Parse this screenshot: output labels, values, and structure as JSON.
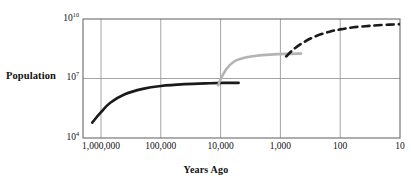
{
  "chart_data": {
    "type": "line",
    "title": "",
    "xlabel": "Years Ago",
    "ylabel": "Population",
    "xscale": "log",
    "yscale": "log",
    "xlim": [
      2000000,
      10
    ],
    "ylim": [
      10000,
      10000000000
    ],
    "x_reversed": true,
    "grid": true,
    "legend_position": "none",
    "xticks": [
      {
        "value": 1000000,
        "label": "1,000,000"
      },
      {
        "value": 100000,
        "label": "100,000"
      },
      {
        "value": 10000,
        "label": "10,000"
      },
      {
        "value": 1000,
        "label": "1,000"
      },
      {
        "value": 100,
        "label": "100"
      },
      {
        "value": 10,
        "label": "10"
      }
    ],
    "yticks": [
      {
        "value": 10000000000,
        "label": "10",
        "exponent": "10"
      },
      {
        "value": 10000000,
        "label": "10",
        "exponent": "7"
      },
      {
        "value": 10000,
        "label": "10",
        "exponent": "4"
      }
    ],
    "series": [
      {
        "name": "hunter-gatherer-phase",
        "style": "solid",
        "color": "#1a1a1a",
        "width": 2.6,
        "points": [
          {
            "x": 1400000,
            "y": 60000
          },
          {
            "x": 1000000,
            "y": 200000
          },
          {
            "x": 700000,
            "y": 600000
          },
          {
            "x": 400000,
            "y": 1600000
          },
          {
            "x": 200000,
            "y": 3000000
          },
          {
            "x": 100000,
            "y": 4200000
          },
          {
            "x": 40000,
            "y": 5200000
          },
          {
            "x": 15000,
            "y": 5800000
          },
          {
            "x": 9000,
            "y": 6000000
          },
          {
            "x": 5000,
            "y": 6000000
          }
        ]
      },
      {
        "name": "agricultural-phase",
        "style": "solid",
        "color": "#b3b3b3",
        "width": 2.6,
        "points": [
          {
            "x": 11000,
            "y": 4500000
          },
          {
            "x": 10000,
            "y": 9000000
          },
          {
            "x": 8000,
            "y": 30000000
          },
          {
            "x": 6000,
            "y": 70000000
          },
          {
            "x": 4000,
            "y": 110000000
          },
          {
            "x": 2500,
            "y": 140000000
          },
          {
            "x": 1500,
            "y": 160000000
          },
          {
            "x": 800,
            "y": 175000000
          },
          {
            "x": 450,
            "y": 180000000
          }
        ]
      },
      {
        "name": "industrial-phase",
        "style": "dashed",
        "color": "#1a1a1a",
        "width": 2.6,
        "dash": "7,5",
        "points": [
          {
            "x": 800,
            "y": 130000000
          },
          {
            "x": 600,
            "y": 300000000
          },
          {
            "x": 400,
            "y": 700000000
          },
          {
            "x": 250,
            "y": 1400000000
          },
          {
            "x": 150,
            "y": 2300000000
          },
          {
            "x": 100,
            "y": 3000000000
          },
          {
            "x": 60,
            "y": 3800000000
          },
          {
            "x": 30,
            "y": 4600000000
          },
          {
            "x": 15,
            "y": 5200000000
          },
          {
            "x": 10,
            "y": 5500000000
          }
        ]
      }
    ]
  },
  "axis": {
    "ylabel": "Population",
    "xlabel": "Years Ago"
  }
}
